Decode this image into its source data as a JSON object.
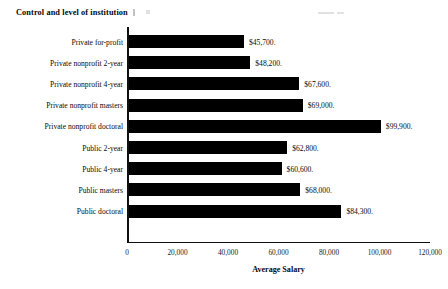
{
  "chart_data": {
    "type": "bar",
    "orientation": "horizontal",
    "title": "Control and level of institution",
    "xlabel": "Average Salary",
    "ylabel": "",
    "xlim": [
      0,
      120000
    ],
    "grid": false,
    "legend": false,
    "xticks": [
      "0",
      "20,000",
      "40,000",
      "60,000",
      "80,000",
      "100,000",
      "120,000"
    ],
    "xtick_values": [
      0,
      20000,
      40000,
      60000,
      80000,
      100000,
      120000
    ],
    "categories": [
      "Private for-profit",
      "Private nonprofit 2-year",
      "Private nonprofit 4-year",
      "Private nonprofit masters",
      "Private nonprofit doctoral",
      "Public 2-year",
      "Public 4-year",
      "Public masters",
      "Public doctoral"
    ],
    "values": [
      45700,
      48200,
      67600,
      69000,
      99900,
      62800,
      60600,
      68000,
      84300
    ],
    "data_labels": [
      "$45,700.",
      "$48,200.",
      "$67,600.",
      "$69,000.",
      "$99,900.",
      "$62,800.",
      "$60,600.",
      "$68,000.",
      "$84,300."
    ],
    "bar_color": "#000000"
  }
}
